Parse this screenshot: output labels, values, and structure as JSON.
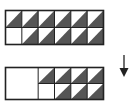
{
  "diagram": {
    "colors": {
      "fill": "#555555",
      "stroke": "#222222",
      "background": "#ffffff",
      "empty": "#ffffff"
    },
    "top_grid": {
      "columns": 6,
      "rows": 2,
      "cells": [
        [
          1,
          1,
          1,
          1,
          1,
          1
        ],
        [
          0,
          1,
          1,
          1,
          1,
          1
        ]
      ]
    },
    "bottom_grid": {
      "columns": 6,
      "rows": 2,
      "merged_blank_columns": 2,
      "cells": [
        [
          0,
          0,
          1,
          1,
          1,
          1
        ],
        [
          0,
          0,
          0,
          1,
          1,
          1
        ]
      ]
    },
    "arrow": {
      "direction": "down",
      "icon": "arrow-down-icon"
    }
  }
}
